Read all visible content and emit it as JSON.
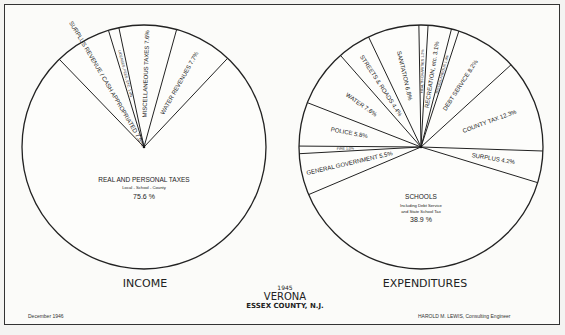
{
  "chart_data": [
    {
      "type": "pie",
      "title": "INCOME",
      "center": [
        144,
        147
      ],
      "radius": 122,
      "start_angle_deg": -44,
      "slices": [
        {
          "label": "SURPLUS REVENUE CASH APPROPRIATED",
          "value": 7.5,
          "display": "SURPLUS REVENUE / CASH APPROPRIATED 7.5%"
        },
        {
          "label": "LICENSES, FEES, ETC.",
          "value": 1.4,
          "display": "LICENSES, FEES, ETC. 1.4%"
        },
        {
          "label": "MISCELLANEOUS TAXES",
          "value": 7.6,
          "display": "MISCELLANEOUS TAXES 7.6%"
        },
        {
          "label": "WATER REVENUES",
          "value": 7.7,
          "display": "WATER REVENUES 7.7%"
        },
        {
          "label": "REAL AND PERSONAL TAXES",
          "sublabel": "Local - School - County",
          "value": 75.6,
          "display": "75.6%"
        }
      ]
    },
    {
      "type": "pie",
      "title": "EXPENDITURES",
      "center": [
        421,
        147
      ],
      "radius": 122,
      "start_angle_deg": -1,
      "slices": [
        {
          "label": "HEALTH-CHARITIES",
          "value": 1.2,
          "display": "HEALTH-CHARITIES 1.2%"
        },
        {
          "label": "RECREATION, etc.",
          "value": 3.1,
          "display": "RECREATION, etc. 3.1%"
        },
        {
          "label": "MISCELLANEOUS",
          "value": 1.0,
          "display": "MISCELLANEOUS 1.0%"
        },
        {
          "label": "DEBT SERVICE",
          "value": 8.2,
          "display": "DEBT SERVICE 8.2%"
        },
        {
          "label": "COUNTY TAX",
          "value": 12.3,
          "display": "COUNTY TAX 12.3%"
        },
        {
          "label": "SURPLUS",
          "value": 4.2,
          "display": "SURPLUS 4.2%"
        },
        {
          "label": "SCHOOLS",
          "sublabel": "Including Debt Service and State School Tax",
          "value": 38.9,
          "display": "38.9%"
        },
        {
          "label": "GENERAL GOVERNMENT",
          "value": 5.5,
          "display": "GENERAL GOVERNMENT 5.5%"
        },
        {
          "label": "FIRE",
          "value": 1.0,
          "display": "FIRE 1.0%"
        },
        {
          "label": "POLICE",
          "value": 5.8,
          "display": "POLICE 5.8%"
        },
        {
          "label": "WATER",
          "value": 7.6,
          "display": "WATER 7.6%"
        },
        {
          "label": "STREETS & ROADS",
          "value": 4.4,
          "display": "STREETS & ROADS 4.4%"
        },
        {
          "label": "SANITATION",
          "value": 6.8,
          "display": "SANITATION 6.8%"
        }
      ]
    }
  ],
  "footer": {
    "year": "1945",
    "town": "VERONA",
    "county": "ESSEX COUNTY, N.J.",
    "date": "December 1946",
    "credit": "HAROLD M. LEWIS, Consulting Engineer",
    "income_title": "INCOME",
    "expenditures_title": "EXPENDITURES"
  },
  "labels": {
    "income_main": "REAL AND PERSONAL TAXES",
    "income_sub": "Local - School - County",
    "income_pct": "75.6 %",
    "schools_main": "SCHOOLS",
    "schools_sub1": "Including Debt Service",
    "schools_sub2": "and State School Tax",
    "schools_pct": "38.9 %"
  }
}
